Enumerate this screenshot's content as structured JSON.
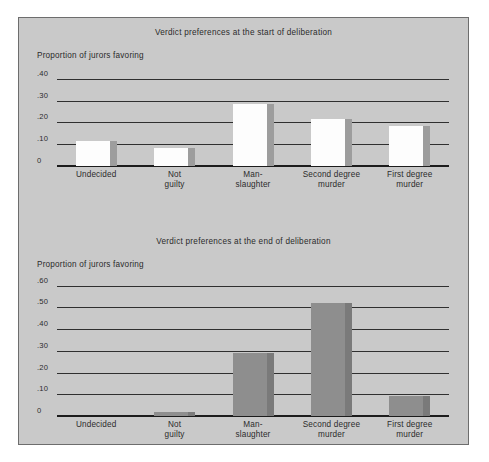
{
  "figure": {
    "background": "#c9c9c9",
    "border_color": "#6d6d6d",
    "page_background": "#ffffff"
  },
  "chart_data": [
    {
      "type": "bar",
      "title": "Verdict preferences at the start of deliberation",
      "ylabel": "Proportion of  jurors favoring",
      "xlabel": "",
      "categories": [
        "Undecided",
        "Not\nguilty",
        "Man-\nslaughter",
        "Second degree\nmurder",
        "First degree\nmurder"
      ],
      "values": [
        0.115,
        0.085,
        0.285,
        0.215,
        0.185
      ],
      "ylim": [
        0,
        0.45
      ],
      "yticks": [
        0,
        0.1,
        0.2,
        0.3,
        0.4
      ],
      "ytick_labels": [
        "0",
        ".10",
        ".20",
        ".30",
        ".40"
      ],
      "grid": true,
      "legend": "none",
      "bar_style": "white-with-gray-shadow",
      "bar_face_color": "#fdfdfd",
      "bar_shadow_color": "#9d9d9d"
    },
    {
      "type": "bar",
      "title": "Verdict preferences at the end of deliberation",
      "ylabel": "Proportion of jurors favoring",
      "xlabel": "",
      "categories": [
        "Undecided",
        "Not\nguilty",
        "Man-\nslaughter",
        "Second degree\nmurder",
        "First degree\nmurder"
      ],
      "values": [
        0.0,
        0.02,
        0.29,
        0.52,
        0.09
      ],
      "ylim": [
        0,
        0.64
      ],
      "yticks": [
        0,
        0.1,
        0.2,
        0.3,
        0.4,
        0.5,
        0.6
      ],
      "ytick_labels": [
        "0",
        ".10",
        ".20",
        ".30",
        ".40",
        ".50",
        ".60"
      ],
      "grid": true,
      "legend": "none",
      "bar_style": "solid-gray",
      "bar_face_color": "#8e8e8e",
      "bar_shadow_color": "#7a7a7a"
    }
  ]
}
